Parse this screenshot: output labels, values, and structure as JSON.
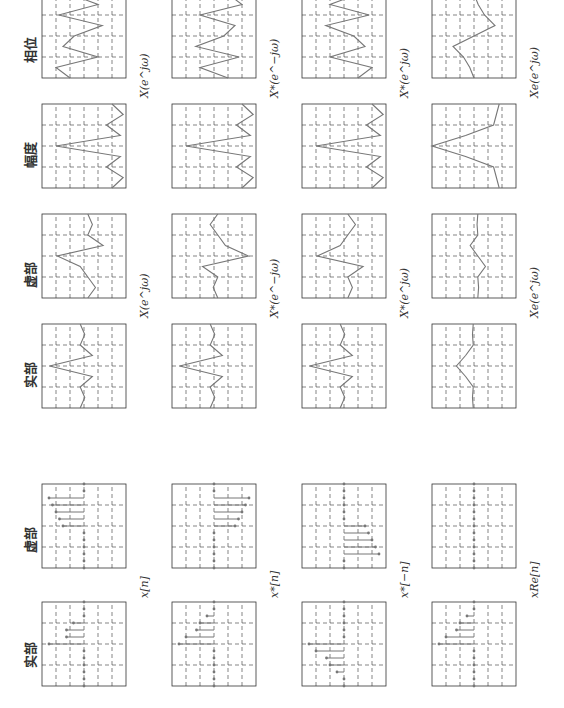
{
  "figure": {
    "column_headers": {
      "seq_real": "实部",
      "seq_imag": "虚部",
      "spec_real": "实部",
      "spec_imag": "虚部",
      "spec_mag": "幅度",
      "spec_phase": "相位"
    },
    "row_labels": {
      "seq": [
        "x[n]",
        "x*[n]",
        "x*[−n]",
        "xRe[n]"
      ],
      "spec_ri": [
        "X(e^jω)",
        "X*(e^−jω)",
        "X*(e^jω)",
        "Xe(e^jω)"
      ],
      "spec_mp": [
        "X(e^jω)",
        "X*(e^−jω)",
        "X*(e^jω)",
        "Xe(e^jω)"
      ]
    },
    "colors": {
      "line": "#777777",
      "grid": "#333333",
      "text": "#333333"
    }
  },
  "chart_data": [
    {
      "type": "stem",
      "title": "x[n] 实部",
      "n": [
        -6,
        -5,
        -4,
        -3,
        -2,
        -1,
        0,
        1,
        2,
        3,
        4,
        5,
        6
      ],
      "values": [
        0,
        0,
        0,
        0,
        0,
        0,
        5,
        2.5,
        2.5,
        1.5,
        0,
        0,
        0
      ],
      "ylim": [
        -6,
        6
      ],
      "xticks": [
        -6,
        -5,
        -4,
        -3,
        -2,
        -1,
        0,
        1,
        2,
        3,
        4,
        5,
        6
      ]
    },
    {
      "type": "stem",
      "title": "x[n] 虚部",
      "n": [
        -6,
        -5,
        -4,
        -3,
        -2,
        -1,
        0,
        1,
        2,
        3,
        4,
        5,
        6
      ],
      "values": [
        0,
        0,
        0,
        0,
        0,
        0,
        3,
        3.5,
        4,
        4.5,
        5,
        0,
        0
      ],
      "ylim": [
        -6,
        6
      ],
      "xticks": [
        -6,
        -5,
        -4,
        -3,
        -2,
        -1,
        0,
        1,
        2,
        3,
        4,
        5,
        6
      ]
    },
    {
      "type": "stem",
      "title": "x*[n] 实部",
      "n": [
        -6,
        -5,
        -4,
        -3,
        -2,
        -1,
        0,
        1,
        2,
        3,
        4,
        5,
        6
      ],
      "values": [
        0,
        0,
        0,
        0,
        0,
        0,
        5,
        4,
        2.5,
        2,
        1,
        0,
        0
      ],
      "ylim": [
        -6,
        6
      ],
      "xticks": [
        -5,
        0,
        5
      ]
    },
    {
      "type": "stem",
      "title": "x*[n] 虚部",
      "n": [
        -6,
        -5,
        -4,
        -3,
        -2,
        -1,
        0,
        1,
        2,
        3,
        4,
        5,
        6
      ],
      "values": [
        0,
        0,
        0,
        0,
        0,
        0,
        -3,
        -3.5,
        -4,
        -4.5,
        -5,
        0,
        0
      ],
      "ylim": [
        -6,
        6
      ],
      "xticks": [
        -5,
        0,
        5
      ]
    },
    {
      "type": "stem",
      "title": "x*[-n] 实部",
      "n": [
        -6,
        -5,
        -4,
        -3,
        -2,
        -1,
        0,
        1,
        2,
        3,
        4,
        5,
        6
      ],
      "values": [
        0,
        0,
        1,
        2,
        2.5,
        4,
        5,
        0,
        0,
        0,
        0,
        0,
        0
      ],
      "ylim": [
        -6,
        6
      ],
      "xticks": [
        -5,
        0,
        5
      ]
    },
    {
      "type": "stem",
      "title": "x*[-n] 虚部",
      "n": [
        -6,
        -5,
        -4,
        -3,
        -2,
        -1,
        0,
        1,
        2,
        3,
        4,
        5,
        6
      ],
      "values": [
        0,
        0,
        -5,
        -4.5,
        -4,
        -3.5,
        -3,
        0,
        0,
        0,
        0,
        0,
        0
      ],
      "ylim": [
        -6,
        6
      ],
      "xticks": [
        -5,
        0,
        5
      ]
    },
    {
      "type": "stem",
      "title": "xRe[n] 实部",
      "n": [
        -6,
        -5,
        -4,
        -3,
        -2,
        -1,
        0,
        1,
        2,
        3,
        4,
        5,
        6
      ],
      "values": [
        0,
        0,
        0,
        0,
        0,
        0,
        5,
        4,
        2.5,
        2,
        1,
        0,
        0
      ],
      "ylim": [
        -6,
        6
      ],
      "xticks": [
        -5,
        0,
        5
      ]
    },
    {
      "type": "stem",
      "title": "xRe[n] 虚部",
      "n": [
        -6,
        -5,
        -4,
        -3,
        -2,
        -1,
        0,
        1,
        2,
        3,
        4,
        5,
        6
      ],
      "values": [
        0,
        0,
        0,
        0,
        0,
        0,
        0,
        0,
        0,
        0,
        0,
        0,
        0
      ],
      "ylim": [
        -6,
        6
      ],
      "xticks": [
        -5,
        0,
        5
      ]
    },
    {
      "type": "line",
      "title": "X(e^jω) 实部",
      "x": [
        -3.14,
        -2.36,
        -1.57,
        -0.79,
        0,
        0.79,
        1.57,
        2.36,
        3.14
      ],
      "values": [
        5,
        2,
        5,
        -3,
        25,
        -3,
        5,
        2,
        5
      ],
      "ylim": [
        -25,
        30
      ],
      "xticks": [
        "−π",
        "−π/2",
        "0",
        "π/2",
        "π"
      ]
    },
    {
      "type": "line",
      "title": "X(e^jω) 虚部",
      "x": [
        -3.14,
        -2.36,
        -1.57,
        -0.79,
        0,
        0.79,
        1.57,
        2.36,
        3.14
      ],
      "values": [
        0,
        -5,
        0,
        5,
        20,
        -10,
        0,
        -3,
        0
      ],
      "ylim": [
        -25,
        30
      ],
      "xticks": [
        "−π",
        "−π/2",
        "0",
        "π/2",
        "π"
      ]
    },
    {
      "type": "line",
      "title": "X(e^jω) 幅度",
      "x": [
        -3.14,
        -2.36,
        -1.57,
        -0.79,
        0,
        0.79,
        1.57,
        2.36,
        3.14
      ],
      "values": [
        5,
        1,
        7,
        2,
        25,
        2,
        7,
        1,
        5
      ],
      "ylim": [
        0,
        30
      ],
      "xticks": [
        "−π",
        "−π/2",
        "0",
        "π/2",
        "π"
      ]
    },
    {
      "type": "line",
      "title": "X(e^jω) 相位",
      "x": [
        -3.14,
        -2.36,
        -1.57,
        -0.79,
        0,
        0.79,
        1.57,
        2.36,
        3.14
      ],
      "values": [
        1,
        2,
        -1,
        1.5,
        0.7,
        -1.3,
        1.8,
        -1,
        1
      ],
      "ylim": [
        -3,
        3
      ],
      "xticks": [
        "−π",
        "−π/2",
        "0",
        "π/2",
        "π"
      ]
    },
    {
      "type": "line",
      "title": "X*(e^-jω) 实部",
      "x": [
        -3.14,
        -2.36,
        -1.57,
        -0.79,
        0,
        0.79,
        1.57,
        2.36,
        3.14
      ],
      "values": [
        5,
        2,
        5,
        -3,
        25,
        -3,
        5,
        2,
        5
      ],
      "ylim": [
        -25,
        30
      ]
    },
    {
      "type": "line",
      "title": "X*(e^-jω) 虚部",
      "x": [
        -3.14,
        -2.36,
        -1.57,
        -0.79,
        0,
        0.79,
        1.57,
        2.36,
        3.14
      ],
      "values": [
        0,
        3,
        0,
        10,
        -20,
        -5,
        0,
        5,
        0
      ],
      "ylim": [
        -25,
        30
      ]
    },
    {
      "type": "line",
      "title": "X*(e^-jω) 幅度",
      "x": [
        -3.14,
        -2.36,
        -1.57,
        -0.79,
        0,
        0.79,
        1.57,
        2.36,
        3.14
      ],
      "values": [
        5,
        1,
        7,
        2,
        25,
        2,
        7,
        1,
        5
      ],
      "ylim": [
        0,
        30
      ]
    },
    {
      "type": "line",
      "title": "X*(e^-jω) 相位",
      "x": [
        -3.14,
        -2.36,
        -1.57,
        -0.79,
        0,
        0.79,
        1.57,
        2.36,
        3.14
      ],
      "values": [
        -1,
        1,
        -1.8,
        1.3,
        -0.7,
        -1.5,
        1,
        -2,
        -1
      ],
      "ylim": [
        -3,
        3
      ]
    },
    {
      "type": "line",
      "title": "X*(e^jω) 实部",
      "x": [
        -3.14,
        -2.36,
        -1.57,
        -0.79,
        0,
        0.79,
        1.57,
        2.36,
        3.14
      ],
      "values": [
        5,
        2,
        5,
        -3,
        25,
        -3,
        5,
        2,
        5
      ],
      "ylim": [
        -25,
        30
      ]
    },
    {
      "type": "line",
      "title": "X*(e^jω) 虚部",
      "x": [
        -3.14,
        -2.36,
        -1.57,
        -0.79,
        0,
        0.79,
        1.57,
        2.36,
        3.14
      ],
      "values": [
        0,
        -3,
        0,
        -10,
        20,
        5,
        0,
        -5,
        0
      ],
      "ylim": [
        -25,
        30
      ]
    },
    {
      "type": "line",
      "title": "X*(e^jω) 幅度",
      "x": [
        -3.14,
        -2.36,
        -1.57,
        -0.79,
        0,
        0.79,
        1.57,
        2.36,
        3.14
      ],
      "values": [
        5,
        1,
        7,
        2,
        25,
        2,
        7,
        1,
        5
      ],
      "ylim": [
        0,
        30
      ]
    },
    {
      "type": "line",
      "title": "X*(e^jω) 相位",
      "x": [
        -3.14,
        -2.36,
        -1.57,
        -0.79,
        0,
        0.79,
        1.57,
        2.36,
        3.14
      ],
      "values": [
        -1,
        -2,
        1,
        -1.5,
        -0.7,
        1.3,
        -1.8,
        1,
        -1
      ],
      "ylim": [
        -3,
        3
      ]
    },
    {
      "type": "line",
      "title": "Xe(e^jω) 实部",
      "x": [
        -3.14,
        -2.36,
        -1.57,
        -0.79,
        0,
        0.79,
        1.57,
        2.36,
        3.14
      ],
      "values": [
        3,
        3.5,
        3,
        8,
        14,
        8,
        3,
        3.5,
        3
      ],
      "ylim": [
        -25,
        30
      ]
    },
    {
      "type": "line",
      "title": "Xe(e^jω) 虚部",
      "x": [
        -3.14,
        -2.36,
        -1.57,
        -0.79,
        0,
        0.79,
        1.57,
        2.36,
        3.14
      ],
      "values": [
        0,
        -0.5,
        0,
        -5,
        0,
        5,
        0,
        0.5,
        0
      ],
      "ylim": [
        -25,
        30
      ]
    },
    {
      "type": "line",
      "title": "Xe(e^jω) 幅度",
      "x": [
        -3.14,
        -2.36,
        -1.57,
        -0.79,
        0,
        0.79,
        1.57,
        2.36,
        3.14
      ],
      "values": [
        3,
        3.5,
        4,
        9,
        15,
        9,
        4,
        3.5,
        3
      ],
      "ylim": [
        0,
        15
      ]
    },
    {
      "type": "line",
      "title": "Xe(e^jω) 相位",
      "x": [
        -3.14,
        -2.36,
        -1.57,
        -0.79,
        0,
        0.79,
        1.57,
        2.36,
        3.14
      ],
      "values": [
        0,
        0.2,
        0.5,
        1,
        0,
        -1,
        -0.5,
        -0.2,
        0
      ],
      "ylim": [
        -2,
        2
      ]
    }
  ]
}
